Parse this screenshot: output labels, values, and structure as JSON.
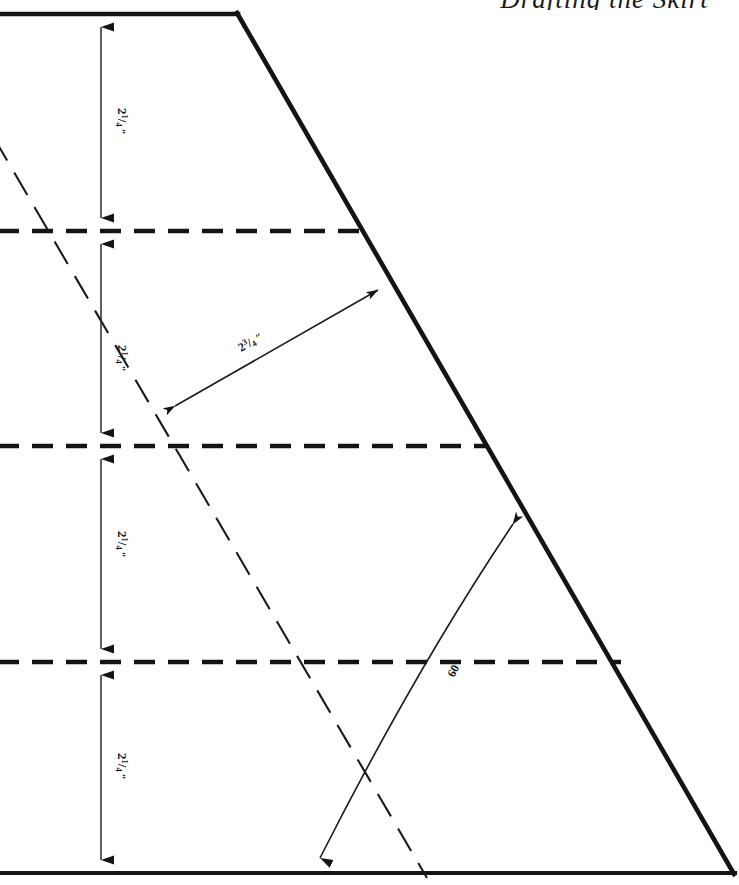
{
  "page": {
    "width": 739,
    "height": 885,
    "background": "#ffffff",
    "ink_color": "#141414"
  },
  "header": {
    "partial_text": "Drafting the Skirt",
    "note": "cropped script heading at top edge"
  },
  "dimensions": {
    "vertical_segments": [
      {
        "id": "seg-1",
        "label": "2¼″",
        "whole": "2",
        "numerator": "1",
        "denominator": "4",
        "unit": "″"
      },
      {
        "id": "seg-2",
        "label": "2¼″",
        "whole": "2",
        "numerator": "1",
        "denominator": "4",
        "unit": "″"
      },
      {
        "id": "seg-3",
        "label": "2¼″",
        "whole": "2",
        "numerator": "1",
        "denominator": "4",
        "unit": "″"
      },
      {
        "id": "seg-4",
        "label": "2¼″",
        "whole": "2",
        "numerator": "1",
        "denominator": "4",
        "unit": "″"
      }
    ],
    "diagonal": {
      "id": "diag-dim",
      "label": "2¾″",
      "whole": "2",
      "numerator": "3",
      "denominator": "4",
      "unit": "″"
    },
    "angle": {
      "id": "angle-dim",
      "label": "60°",
      "value": "60",
      "unit": "°"
    }
  },
  "geometry": {
    "shape_outline": {
      "name": "trapezoid-outline",
      "points": "0,14 237,14 733,873 0,873",
      "stroke_width": 4.5
    },
    "top_edge": {
      "x1": 0,
      "y1": 14,
      "x2": 237,
      "y2": 14
    },
    "slant_edge": {
      "x1": 237,
      "y1": 14,
      "x2": 733,
      "y2": 873
    },
    "bottom_edge": {
      "x1": 0,
      "y1": 873,
      "x2": 733,
      "y2": 873
    },
    "dashed_horizontals": [
      {
        "id": "dash-h-1",
        "y": 231,
        "x_start": 0,
        "x_end": 362
      },
      {
        "id": "dash-h-2",
        "y": 446,
        "x_start": 0,
        "x_end": 486
      },
      {
        "id": "dash-h-3",
        "y": 662,
        "x_start": 0,
        "x_end": 620
      }
    ],
    "dashed_diagonal": {
      "id": "dash-diag",
      "x1": -4,
      "y1": 140,
      "x2": 426,
      "y2": 876
    },
    "dimension_line_x": 101,
    "diagonal_arrow": {
      "x1": 163,
      "y1": 413,
      "x2": 389,
      "y2": 284
    },
    "angle_arc": {
      "start_x": 311,
      "start_y": 876,
      "end_x": 521,
      "end_y": 517,
      "control_x": 322,
      "control_y": 600
    }
  },
  "colors": {
    "ink": "#141414",
    "thin_line": "#1a1a1a",
    "paper": "#ffffff"
  }
}
